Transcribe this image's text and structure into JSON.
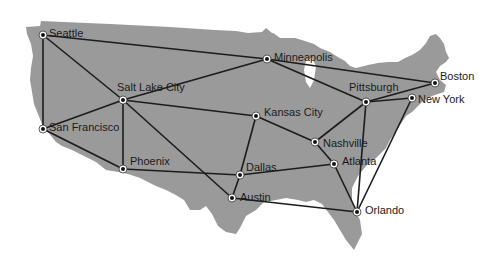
{
  "diagram": {
    "type": "network-map",
    "land_color": "#9a9a9a",
    "edge_color": "#1c1c1c",
    "node_fill": "#ffffff",
    "node_center": "#111111",
    "nodes": [
      {
        "id": "seattle",
        "label": "Seattle",
        "x": 43,
        "y": 35,
        "lx": 49,
        "ly": 27
      },
      {
        "id": "salt-lake-city",
        "label": "Salt Lake City",
        "x": 123,
        "y": 100,
        "lx": 117,
        "ly": 81
      },
      {
        "id": "san-francisco",
        "label": "San Francisco",
        "x": 43,
        "y": 129,
        "lx": 49,
        "ly": 121
      },
      {
        "id": "phoenix",
        "label": "Phoenix",
        "x": 123,
        "y": 169,
        "lx": 130,
        "ly": 155
      },
      {
        "id": "minneapolis",
        "label": "Minneapolis",
        "x": 267,
        "y": 59,
        "lx": 274,
        "ly": 51
      },
      {
        "id": "kansas-city",
        "label": "Kansas City",
        "x": 256,
        "y": 116,
        "lx": 264,
        "ly": 106
      },
      {
        "id": "dallas",
        "label": "Dallas",
        "x": 240,
        "y": 175,
        "lx": 246,
        "ly": 161
      },
      {
        "id": "austin",
        "label": "Austin",
        "x": 232,
        "y": 198,
        "lx": 240,
        "ly": 191
      },
      {
        "id": "nashville",
        "label": "Nashville",
        "x": 315,
        "y": 142,
        "lx": 323,
        "ly": 137
      },
      {
        "id": "atlanta",
        "label": "Atlanta",
        "x": 334,
        "y": 164,
        "lx": 342,
        "ly": 155
      },
      {
        "id": "pittsburgh",
        "label": "Pittsburgh",
        "x": 366,
        "y": 102,
        "lx": 349,
        "ly": 81
      },
      {
        "id": "boston",
        "label": "Boston",
        "x": 435,
        "y": 83,
        "lx": 440,
        "ly": 70
      },
      {
        "id": "new-york",
        "label": "New York",
        "x": 412,
        "y": 98,
        "lx": 418,
        "ly": 93
      },
      {
        "id": "orlando",
        "label": "Orlando",
        "x": 357,
        "y": 212,
        "lx": 365,
        "ly": 204
      }
    ],
    "edges": [
      [
        "seattle",
        "salt-lake-city"
      ],
      [
        "seattle",
        "san-francisco"
      ],
      [
        "seattle",
        "minneapolis"
      ],
      [
        "san-francisco",
        "salt-lake-city"
      ],
      [
        "san-francisco",
        "phoenix"
      ],
      [
        "salt-lake-city",
        "phoenix"
      ],
      [
        "salt-lake-city",
        "minneapolis"
      ],
      [
        "salt-lake-city",
        "kansas-city"
      ],
      [
        "salt-lake-city",
        "austin"
      ],
      [
        "phoenix",
        "dallas"
      ],
      [
        "minneapolis",
        "boston"
      ],
      [
        "minneapolis",
        "pittsburgh"
      ],
      [
        "kansas-city",
        "dallas"
      ],
      [
        "kansas-city",
        "nashville"
      ],
      [
        "dallas",
        "austin"
      ],
      [
        "dallas",
        "atlanta"
      ],
      [
        "austin",
        "orlando"
      ],
      [
        "nashville",
        "pittsburgh"
      ],
      [
        "nashville",
        "atlanta"
      ],
      [
        "atlanta",
        "orlando"
      ],
      [
        "pittsburgh",
        "boston"
      ],
      [
        "pittsburgh",
        "new-york"
      ],
      [
        "pittsburgh",
        "orlando"
      ],
      [
        "new-york",
        "orlando"
      ]
    ]
  }
}
